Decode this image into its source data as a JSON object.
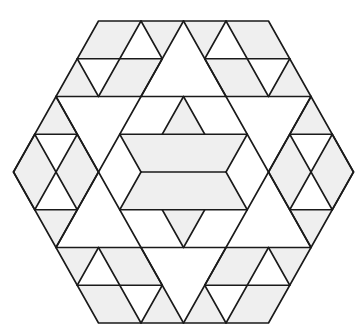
{
  "figure": {
    "colors": {
      "background": "#ffffff",
      "fill": "#efefef",
      "stroke": "#1a1a1a"
    },
    "lattice": {
      "origin_x": 183.5,
      "origin_y": 172,
      "half_unit_x": 21.25,
      "row_height": 37.75,
      "stroke_width": 1.6
    },
    "outline": [
      [
        -4,
        -4
      ],
      [
        4,
        -4
      ],
      [
        8,
        0
      ],
      [
        4,
        4
      ],
      [
        -4,
        4
      ],
      [
        -8,
        0
      ]
    ],
    "gray_polygons": [
      [
        [
          -4,
          -4
        ],
        [
          -2,
          -4
        ],
        [
          -3,
          -3
        ],
        [
          -5,
          -3
        ]
      ],
      [
        [
          -2,
          -4
        ],
        [
          0,
          -4
        ],
        [
          -1,
          -3
        ]
      ],
      [
        [
          -3,
          -3
        ],
        [
          -1,
          -3
        ],
        [
          -2,
          -2
        ],
        [
          -4,
          -2
        ]
      ],
      [
        [
          -5,
          -3
        ],
        [
          -4,
          -2
        ],
        [
          -6,
          -2
        ]
      ],
      [
        [
          4,
          -4
        ],
        [
          2,
          -4
        ],
        [
          3,
          -3
        ],
        [
          5,
          -3
        ]
      ],
      [
        [
          2,
          -4
        ],
        [
          0,
          -4
        ],
        [
          1,
          -3
        ]
      ],
      [
        [
          3,
          -3
        ],
        [
          1,
          -3
        ],
        [
          2,
          -2
        ],
        [
          4,
          -2
        ]
      ],
      [
        [
          5,
          -3
        ],
        [
          4,
          -2
        ],
        [
          6,
          -2
        ]
      ],
      [
        [
          -4,
          4
        ],
        [
          -2,
          4
        ],
        [
          -3,
          3
        ],
        [
          -5,
          3
        ]
      ],
      [
        [
          -2,
          4
        ],
        [
          0,
          4
        ],
        [
          -1,
          3
        ]
      ],
      [
        [
          -3,
          3
        ],
        [
          -1,
          3
        ],
        [
          -2,
          2
        ],
        [
          -4,
          2
        ]
      ],
      [
        [
          -5,
          3
        ],
        [
          -4,
          2
        ],
        [
          -6,
          2
        ]
      ],
      [
        [
          4,
          4
        ],
        [
          2,
          4
        ],
        [
          3,
          3
        ],
        [
          5,
          3
        ]
      ],
      [
        [
          2,
          4
        ],
        [
          0,
          4
        ],
        [
          1,
          3
        ]
      ],
      [
        [
          3,
          3
        ],
        [
          1,
          3
        ],
        [
          2,
          2
        ],
        [
          4,
          2
        ]
      ],
      [
        [
          5,
          3
        ],
        [
          4,
          2
        ],
        [
          6,
          2
        ]
      ],
      [
        [
          -6,
          -2
        ],
        [
          -5,
          -1
        ],
        [
          -7,
          -1
        ]
      ],
      [
        [
          -7,
          -1
        ],
        [
          -8,
          0
        ],
        [
          -7,
          1
        ],
        [
          -6,
          0
        ]
      ],
      [
        [
          -5,
          -1
        ],
        [
          -6,
          0
        ],
        [
          -5,
          1
        ],
        [
          -4,
          0
        ]
      ],
      [
        [
          -7,
          1
        ],
        [
          -5,
          1
        ],
        [
          -6,
          2
        ]
      ],
      [
        [
          6,
          -2
        ],
        [
          5,
          -1
        ],
        [
          7,
          -1
        ]
      ],
      [
        [
          7,
          -1
        ],
        [
          8,
          0
        ],
        [
          7,
          1
        ],
        [
          6,
          0
        ]
      ],
      [
        [
          5,
          -1
        ],
        [
          6,
          0
        ],
        [
          5,
          1
        ],
        [
          4,
          0
        ]
      ],
      [
        [
          7,
          1
        ],
        [
          5,
          1
        ],
        [
          6,
          2
        ]
      ],
      [
        [
          -3,
          -1
        ],
        [
          3,
          -1
        ],
        [
          2,
          0
        ],
        [
          -2,
          0
        ]
      ],
      [
        [
          -2,
          0
        ],
        [
          2,
          0
        ],
        [
          3,
          1
        ],
        [
          -3,
          1
        ]
      ],
      [
        [
          0,
          -2
        ],
        [
          1,
          -1
        ],
        [
          -1,
          -1
        ]
      ],
      [
        [
          0,
          2
        ],
        [
          1,
          1
        ],
        [
          -1,
          1
        ]
      ]
    ],
    "segments": [
      [
        [
          -5,
          -3
        ],
        [
          -1,
          -3
        ]
      ],
      [
        [
          1,
          -3
        ],
        [
          5,
          -3
        ]
      ],
      [
        [
          -6,
          -2
        ],
        [
          6,
          -2
        ]
      ],
      [
        [
          -7,
          -1
        ],
        [
          -5,
          -1
        ]
      ],
      [
        [
          -3,
          -1
        ],
        [
          3,
          -1
        ]
      ],
      [
        [
          5,
          -1
        ],
        [
          7,
          -1
        ]
      ],
      [
        [
          -2,
          0
        ],
        [
          2,
          0
        ]
      ],
      [
        [
          -7,
          1
        ],
        [
          -5,
          1
        ]
      ],
      [
        [
          -3,
          1
        ],
        [
          3,
          1
        ]
      ],
      [
        [
          5,
          1
        ],
        [
          7,
          1
        ]
      ],
      [
        [
          -6,
          2
        ],
        [
          6,
          2
        ]
      ],
      [
        [
          -5,
          3
        ],
        [
          -1,
          3
        ]
      ],
      [
        [
          1,
          3
        ],
        [
          5,
          3
        ]
      ],
      [
        [
          -2,
          -4
        ],
        [
          -4,
          -2
        ]
      ],
      [
        [
          -2,
          -4
        ],
        [
          -1,
          -3
        ]
      ],
      [
        [
          -5,
          -3
        ],
        [
          -4,
          -2
        ]
      ],
      [
        [
          -1,
          -3
        ],
        [
          -2,
          -2
        ]
      ],
      [
        [
          2,
          -4
        ],
        [
          4,
          -2
        ]
      ],
      [
        [
          2,
          -4
        ],
        [
          1,
          -3
        ]
      ],
      [
        [
          5,
          -3
        ],
        [
          4,
          -2
        ]
      ],
      [
        [
          1,
          -3
        ],
        [
          2,
          -2
        ]
      ],
      [
        [
          -2,
          4
        ],
        [
          -4,
          2
        ]
      ],
      [
        [
          -2,
          4
        ],
        [
          -1,
          3
        ]
      ],
      [
        [
          -5,
          3
        ],
        [
          -4,
          2
        ]
      ],
      [
        [
          -1,
          3
        ],
        [
          -2,
          2
        ]
      ],
      [
        [
          2,
          4
        ],
        [
          4,
          2
        ]
      ],
      [
        [
          2,
          4
        ],
        [
          1,
          3
        ]
      ],
      [
        [
          5,
          3
        ],
        [
          4,
          2
        ]
      ],
      [
        [
          1,
          3
        ],
        [
          2,
          2
        ]
      ],
      [
        [
          0,
          -4
        ],
        [
          -6,
          2
        ]
      ],
      [
        [
          0,
          -4
        ],
        [
          6,
          2
        ]
      ],
      [
        [
          0,
          4
        ],
        [
          -6,
          -2
        ]
      ],
      [
        [
          0,
          4
        ],
        [
          6,
          -2
        ]
      ],
      [
        [
          -6,
          -2
        ],
        [
          -4,
          0
        ]
      ],
      [
        [
          6,
          -2
        ],
        [
          4,
          0
        ]
      ],
      [
        [
          -6,
          2
        ],
        [
          -4,
          0
        ]
      ],
      [
        [
          6,
          2
        ],
        [
          4,
          0
        ]
      ],
      [
        [
          -8,
          0
        ],
        [
          -7,
          -1
        ]
      ],
      [
        [
          -7,
          -1
        ],
        [
          -5,
          1
        ]
      ],
      [
        [
          -5,
          -1
        ],
        [
          -7,
          1
        ]
      ],
      [
        [
          -8,
          0
        ],
        [
          -7,
          1
        ]
      ],
      [
        [
          8,
          0
        ],
        [
          7,
          -1
        ]
      ],
      [
        [
          7,
          -1
        ],
        [
          5,
          1
        ]
      ],
      [
        [
          5,
          -1
        ],
        [
          7,
          1
        ]
      ],
      [
        [
          8,
          0
        ],
        [
          7,
          1
        ]
      ],
      [
        [
          0,
          -2
        ],
        [
          1,
          -1
        ]
      ],
      [
        [
          0,
          -2
        ],
        [
          -1,
          -1
        ]
      ],
      [
        [
          0,
          2
        ],
        [
          1,
          1
        ]
      ],
      [
        [
          0,
          2
        ],
        [
          -1,
          1
        ]
      ],
      [
        [
          -3,
          -1
        ],
        [
          -2,
          0
        ]
      ],
      [
        [
          -2,
          0
        ],
        [
          -3,
          1
        ]
      ],
      [
        [
          3,
          -1
        ],
        [
          2,
          0
        ]
      ],
      [
        [
          2,
          0
        ],
        [
          3,
          1
        ]
      ]
    ]
  }
}
